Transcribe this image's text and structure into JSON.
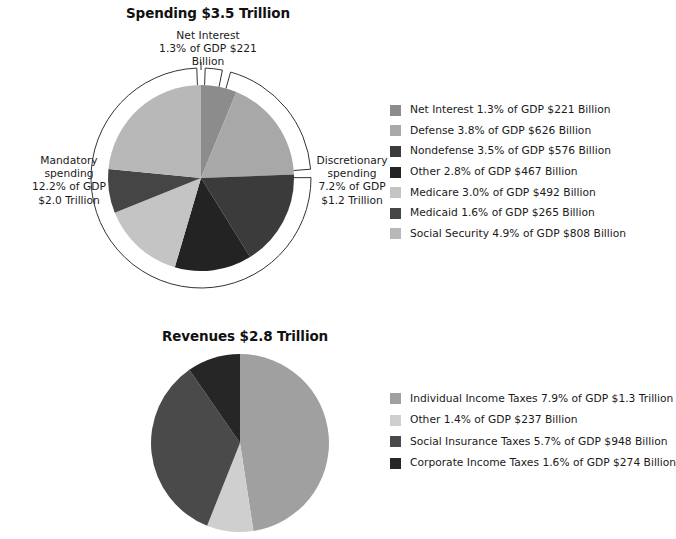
{
  "chart_data": [
    {
      "type": "pie",
      "id": "spending",
      "title": "Spending $3.5 Trillion",
      "total_label": "$3.5 Trillion",
      "categories": [
        "Net Interest",
        "Defense",
        "Nondefense",
        "Other",
        "Medicare",
        "Medicaid",
        "Social Security"
      ],
      "values": [
        1.3,
        3.8,
        3.5,
        2.8,
        3.0,
        1.6,
        4.9
      ],
      "value_unit": "percent of GDP",
      "dollar_values": [
        "$221 Billion",
        "$626 Billion",
        "$576 Billion",
        "$467 Billion",
        "$492 Billion",
        "$265 Billion",
        "$808 Billion"
      ],
      "colors": [
        "#8c8c8c",
        "#a8a8a8",
        "#3b3b3b",
        "#232323",
        "#c4c4c4",
        "#454545",
        "#b8b8b8"
      ],
      "legend_position": "right",
      "grid": false,
      "start_angle_deg": 0,
      "direction": "clockwise",
      "legend": [
        {
          "label": "Net Interest 1.3% of GDP $221 Billion",
          "color": "#8c8c8c"
        },
        {
          "label": "Defense 3.8% of GDP $626 Billion",
          "color": "#a8a8a8"
        },
        {
          "label": "Nondefense 3.5% of GDP $576 Billion",
          "color": "#3b3b3b"
        },
        {
          "label": "Other 2.8% of GDP $467 Billion",
          "color": "#232323"
        },
        {
          "label": "Medicare 3.0% of GDP $492 Billion",
          "color": "#c4c4c4"
        },
        {
          "label": "Medicaid 1.6% of GDP $265 Billion",
          "color": "#454545"
        },
        {
          "label": "Social Security 4.9% of GDP $808 Billion",
          "color": "#b8b8b8"
        }
      ],
      "annotations": [
        {
          "name": "net-interest",
          "text": "Net Interest\n1.3% of GDP $221\nBillion"
        },
        {
          "name": "discretionary-spending",
          "text": "Discretionary\nspending\n7.2% of GDP\n$1.2 Trillion"
        },
        {
          "name": "mandatory-spending",
          "text": "Mandatory\nspending\n12.2% of GDP\n$2.0 Trillion"
        }
      ],
      "brackets": [
        {
          "name": "net-interest-bracket",
          "start_deg": 0,
          "end_deg": 13.4
        },
        {
          "name": "discretionary-bracket",
          "start_deg": 13.4,
          "end_deg": 87.6
        },
        {
          "name": "mandatory-bracket",
          "start_deg": 87.6,
          "end_deg": 360
        }
      ]
    },
    {
      "type": "pie",
      "id": "revenues",
      "title": "Revenues $2.8 Trillion",
      "total_label": "$2.8 Trillion",
      "categories": [
        "Individual Income Taxes",
        "Other",
        "Social Insurance Taxes",
        "Corporate Income Taxes"
      ],
      "values": [
        7.9,
        1.4,
        5.7,
        1.6
      ],
      "value_unit": "percent of GDP",
      "dollar_values": [
        "$1.3 Trillion",
        "$237 Billion",
        "$948 Billion",
        "$274 Billion"
      ],
      "colors": [
        "#a0a0a0",
        "#cfcfcf",
        "#4a4a4a",
        "#262626"
      ],
      "legend_position": "right",
      "grid": false,
      "start_angle_deg": 0,
      "direction": "clockwise",
      "legend": [
        {
          "label": "Individual Income Taxes 7.9% of GDP $1.3 Trillion",
          "color": "#a0a0a0"
        },
        {
          "label": "Other 1.4% of GDP $237 Billion",
          "color": "#cfcfcf"
        },
        {
          "label": "Social Insurance Taxes 5.7% of GDP $948 Billion",
          "color": "#4a4a4a"
        },
        {
          "label": "Corporate Income Taxes 1.6% of GDP $274 Billion",
          "color": "#262626"
        }
      ]
    }
  ],
  "spending": {
    "title": "Spending $3.5 Trillion",
    "annotations": {
      "net_interest": "Net Interest\n1.3% of GDP $221\nBillion",
      "discretionary": "Discretionary\nspending\n7.2% of GDP\n$1.2 Trillion",
      "mandatory": "Mandatory\nspending\n12.2% of GDP\n$2.0 Trillion"
    },
    "legend": [
      {
        "label": "Net Interest 1.3% of GDP $221 Billion",
        "color": "#8c8c8c"
      },
      {
        "label": "Defense 3.8% of GDP $626 Billion",
        "color": "#a8a8a8"
      },
      {
        "label": "Nondefense 3.5% of GDP $576 Billion",
        "color": "#3b3b3b"
      },
      {
        "label": "Other 2.8% of GDP $467 Billion",
        "color": "#232323"
      },
      {
        "label": "Medicare 3.0% of GDP $492 Billion",
        "color": "#c4c4c4"
      },
      {
        "label": "Medicaid 1.6% of GDP $265 Billion",
        "color": "#454545"
      },
      {
        "label": "Social Security 4.9% of GDP $808 Billion",
        "color": "#b8b8b8"
      }
    ]
  },
  "revenues": {
    "title": "Revenues $2.8 Trillion",
    "legend": [
      {
        "label": "Individual Income Taxes 7.9% of GDP $1.3 Trillion",
        "color": "#a0a0a0"
      },
      {
        "label": "Other 1.4% of GDP $237 Billion",
        "color": "#cfcfcf"
      },
      {
        "label": "Social Insurance Taxes 5.7% of GDP $948 Billion",
        "color": "#4a4a4a"
      },
      {
        "label": "Corporate Income Taxes 1.6% of GDP $274 Billion",
        "color": "#262626"
      }
    ]
  }
}
